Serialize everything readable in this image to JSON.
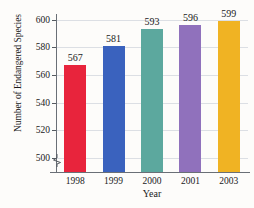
{
  "chart_data": {
    "type": "bar",
    "title": "",
    "xlabel": "Year",
    "ylabel": "Number of Endangered Species",
    "categories": [
      "1998",
      "1999",
      "2000",
      "2001",
      "2003"
    ],
    "values": [
      567,
      581,
      593,
      596,
      599
    ],
    "bar_colors": [
      "#E8243C",
      "#3A62BE",
      "#5CA89E",
      "#9071BC",
      "#F0B323"
    ],
    "ylim": [
      490,
      604
    ],
    "yticks": [
      500,
      520,
      540,
      560,
      580,
      600
    ],
    "ytick_labels": [
      "500",
      "520",
      "540",
      "560",
      "580",
      "600"
    ],
    "grid": true,
    "legend": "none",
    "axis_break": true,
    "axis_break_symbol": "zigzag"
  }
}
